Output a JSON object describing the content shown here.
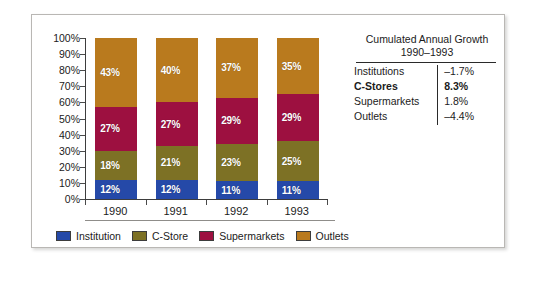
{
  "chart_data": {
    "type": "bar",
    "subtype": "stacked-100-percent",
    "title": "",
    "xlabel": "",
    "ylabel": "",
    "categories": [
      "1990",
      "1991",
      "1992",
      "1993"
    ],
    "ylim": [
      0,
      100
    ],
    "ytick_labels": [
      "100%",
      "90%",
      "80%",
      "70%",
      "60%",
      "50%",
      "40%",
      "30%",
      "20%",
      "10%",
      "0%"
    ],
    "ytick_values": [
      100,
      90,
      80,
      70,
      60,
      50,
      40,
      30,
      20,
      10,
      0
    ],
    "grid": false,
    "legend_position": "bottom",
    "series": [
      {
        "name": "Institution",
        "color": "#2549a8",
        "values": [
          12,
          12,
          11,
          11
        ],
        "labels": [
          "12%",
          "12%",
          "11%",
          "11%"
        ]
      },
      {
        "name": "C-Store",
        "color": "#7d7125",
        "values": [
          18,
          21,
          23,
          25
        ],
        "labels": [
          "18%",
          "21%",
          "23%",
          "25%"
        ]
      },
      {
        "name": "Supermarkets",
        "color": "#9d1040",
        "values": [
          27,
          27,
          29,
          29
        ],
        "labels": [
          "27%",
          "27%",
          "29%",
          "29%"
        ]
      },
      {
        "name": "Outlets",
        "color": "#b97a1e",
        "values": [
          43,
          40,
          37,
          35
        ],
        "labels": [
          "43%",
          "40%",
          "37%",
          "35%"
        ]
      }
    ]
  },
  "legend": {
    "items": [
      {
        "label": "Institution"
      },
      {
        "label": "C-Store"
      },
      {
        "label": "Supermarkets"
      },
      {
        "label": "Outlets"
      }
    ]
  },
  "growth_table": {
    "title_line1": "Cumulated Annual Growth",
    "title_line2": "1990–1993",
    "rows": [
      {
        "name": "Institutions",
        "value": "–1.7%",
        "bold": false
      },
      {
        "name": "C-Stores",
        "value": "8.3%",
        "bold": true
      },
      {
        "name": "Supermarkets",
        "value": "1.8%",
        "bold": false
      },
      {
        "name": "Outlets",
        "value": "–4.4%",
        "bold": false
      }
    ]
  }
}
